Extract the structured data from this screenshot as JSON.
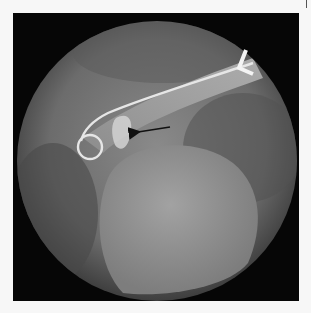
{
  "image": {
    "type": "fluoroscopic angiogram",
    "annotations": {
      "arrow": {
        "direction": "left",
        "color": "#111111"
      },
      "marker_letter": "L"
    },
    "colors": {
      "frame": "#060606",
      "background": "#f7f7f7",
      "field": "#7a7a7a",
      "catheter": "#e8e8e8"
    }
  }
}
